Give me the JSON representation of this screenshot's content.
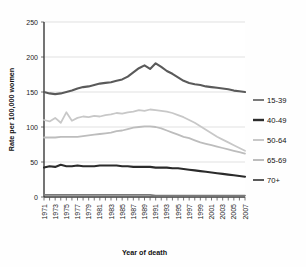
{
  "chart_data": {
    "type": "line",
    "title": "",
    "xlabel": "Year of death",
    "ylabel": "Rate per 100,000 women",
    "ylim": [
      0,
      250
    ],
    "yticks": [
      0,
      50,
      100,
      150,
      200,
      250
    ],
    "xlim": [
      1971,
      2007
    ],
    "grid": true,
    "legend_position": "right",
    "x": [
      1971,
      1972,
      1973,
      1974,
      1975,
      1976,
      1977,
      1978,
      1979,
      1980,
      1981,
      1982,
      1983,
      1984,
      1985,
      1986,
      1987,
      1988,
      1989,
      1990,
      1991,
      1992,
      1993,
      1994,
      1995,
      1996,
      1997,
      1998,
      1999,
      2000,
      2001,
      2002,
      2003,
      2004,
      2005,
      2006,
      2007
    ],
    "xtick_labels": [
      "1971",
      "1973",
      "1975",
      "1977",
      "1979",
      "1981",
      "1983",
      "1985",
      "1987",
      "1989",
      "1991",
      "1993",
      "1995",
      "1997",
      "1999",
      "2001",
      "2003",
      "2005",
      "2007"
    ],
    "series": [
      {
        "name": "15-39",
        "color": "#7a7a7a",
        "values": [
          3,
          3,
          3,
          3,
          3,
          3,
          3,
          3,
          3,
          3,
          3,
          3,
          3,
          3,
          3,
          3,
          3,
          3,
          3,
          3,
          2,
          2,
          2,
          2,
          2,
          2,
          2,
          2,
          2,
          2,
          2,
          2,
          2,
          2,
          2,
          2,
          2
        ]
      },
      {
        "name": "40-49",
        "color": "#2b2b2b",
        "values": [
          42,
          44,
          43,
          46,
          44,
          44,
          45,
          44,
          44,
          44,
          45,
          45,
          45,
          45,
          44,
          44,
          43,
          43,
          43,
          43,
          42,
          42,
          42,
          41,
          41,
          40,
          39,
          38,
          37,
          36,
          35,
          34,
          33,
          32,
          31,
          30,
          29
        ]
      },
      {
        "name": "50-64",
        "color": "#c8c8c8",
        "values": [
          110,
          108,
          113,
          106,
          121,
          109,
          113,
          115,
          114,
          116,
          115,
          117,
          118,
          120,
          119,
          121,
          122,
          124,
          123,
          125,
          124,
          123,
          122,
          120,
          117,
          114,
          110,
          106,
          101,
          96,
          91,
          86,
          82,
          78,
          74,
          70,
          66
        ]
      },
      {
        "name": "65-69",
        "color": "#bdbdbd",
        "values": [
          85,
          85,
          85,
          86,
          86,
          86,
          86,
          87,
          88,
          89,
          90,
          91,
          92,
          94,
          95,
          97,
          99,
          100,
          101,
          101,
          100,
          98,
          95,
          92,
          89,
          86,
          84,
          81,
          78,
          76,
          74,
          72,
          70,
          68,
          66,
          64,
          62
        ]
      },
      {
        "name": "70+",
        "color": "#5a5a5a",
        "values": [
          150,
          148,
          147,
          148,
          150,
          152,
          155,
          157,
          158,
          160,
          162,
          163,
          164,
          166,
          168,
          172,
          178,
          184,
          188,
          183,
          191,
          186,
          180,
          176,
          171,
          166,
          163,
          161,
          160,
          158,
          157,
          156,
          155,
          154,
          152,
          151,
          150
        ]
      }
    ]
  },
  "legend": {
    "entries": [
      {
        "label": "15-39"
      },
      {
        "label": "40-49"
      },
      {
        "label": "50-64"
      },
      {
        "label": "65-69"
      },
      {
        "label": "70+"
      }
    ]
  }
}
